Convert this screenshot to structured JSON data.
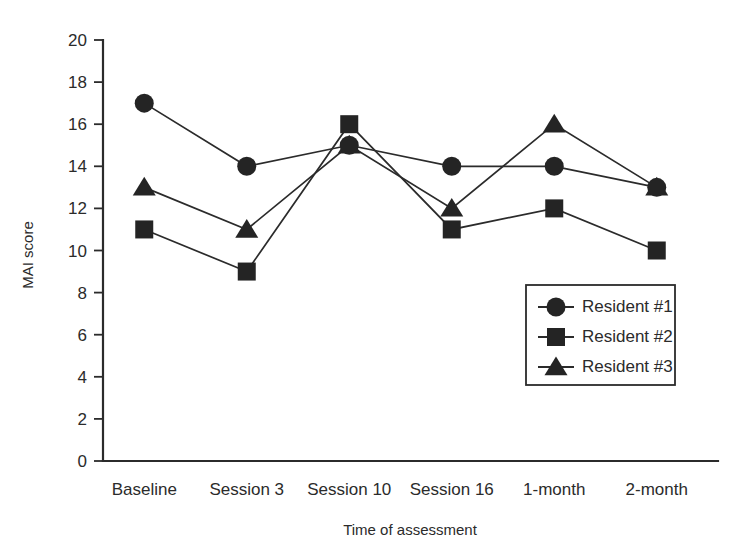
{
  "chart_data": {
    "type": "line",
    "title": "",
    "subtitle": "",
    "xlabel": "Time of assessment",
    "ylabel": "MAI score",
    "categories": [
      "Baseline",
      "Session 3",
      "Session 10",
      "Session 16",
      "1-month",
      "2-month"
    ],
    "ylim": [
      0,
      20
    ],
    "ytick_step": 2,
    "yticks": [
      "20",
      "18",
      "16",
      "14",
      "12",
      "10",
      "8",
      "6",
      "4",
      "2",
      "0"
    ],
    "grid": false,
    "legend_position": "inside-bottom-right",
    "series": [
      {
        "name": "Resident #1",
        "marker": "circle",
        "color": "#242424",
        "values": [
          17,
          14,
          15,
          14,
          14,
          13
        ]
      },
      {
        "name": "Resident #2",
        "marker": "square",
        "color": "#242424",
        "values": [
          11,
          9,
          16,
          11,
          12,
          10
        ]
      },
      {
        "name": "Resident #3",
        "marker": "triangle",
        "color": "#242424",
        "values": [
          13,
          11,
          15,
          12,
          16,
          13
        ]
      }
    ]
  },
  "axes": {
    "y_title": "MAI score",
    "x_title": "Time of assessment"
  },
  "legend": {
    "entries": [
      {
        "label": "Resident #1",
        "marker": "circle-marker-icon"
      },
      {
        "label": "Resident #2",
        "marker": "square-marker-icon"
      },
      {
        "label": "Resident #3",
        "marker": "triangle-marker-icon"
      }
    ]
  }
}
